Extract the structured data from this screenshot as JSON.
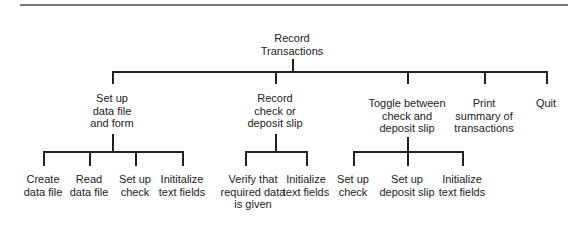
{
  "diagram": {
    "type": "hierarchy-chart",
    "root": {
      "label_lines": [
        "Record",
        "Transactions"
      ]
    },
    "level1": [
      {
        "label_lines": [
          "Set up",
          "data file",
          "and form"
        ],
        "children": [
          {
            "label_lines": [
              "Create",
              "data file"
            ]
          },
          {
            "label_lines": [
              "Read",
              "data file"
            ]
          },
          {
            "label_lines": [
              "Set up",
              "check"
            ]
          },
          {
            "label_lines": [
              "Inititalize",
              "text fields"
            ]
          }
        ]
      },
      {
        "label_lines": [
          "Record",
          "check or",
          "deposit slip"
        ],
        "children": [
          {
            "label_lines": [
              "Verify that",
              "required data",
              "is given"
            ]
          },
          {
            "label_lines": [
              "Initialize",
              "text fields"
            ]
          }
        ]
      },
      {
        "label_lines": [
          "Toggle between",
          "check and",
          "deposit slip"
        ],
        "children": [
          {
            "label_lines": [
              "Set up",
              "check"
            ]
          },
          {
            "label_lines": [
              "Set up",
              "deposit slip"
            ]
          },
          {
            "label_lines": [
              "Initialize",
              "text fields"
            ]
          }
        ]
      },
      {
        "label_lines": [
          "Print",
          "summary of",
          "transactions"
        ],
        "children": []
      },
      {
        "label_lines": [
          "Quit"
        ],
        "children": []
      }
    ]
  },
  "colors": {
    "line": "#222222",
    "rule": "#777777",
    "background": "#ffffff"
  }
}
